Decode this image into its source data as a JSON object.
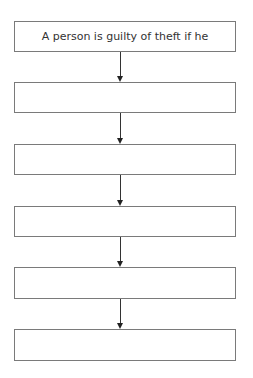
{
  "flowchart": {
    "boxes": [
      {
        "label": "A person is guilty of theft if he"
      },
      {
        "label": ""
      },
      {
        "label": ""
      },
      {
        "label": ""
      },
      {
        "label": ""
      },
      {
        "label": ""
      }
    ],
    "colors": {
      "border": "#7a7a7a",
      "arrow": "#222222",
      "text": "#333333"
    }
  }
}
